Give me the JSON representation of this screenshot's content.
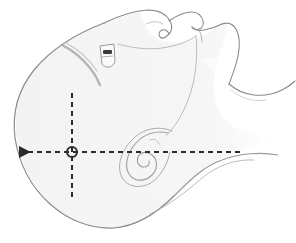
{
  "figure": {
    "background_color": "#ffffff",
    "canvas": {
      "width": 296,
      "height": 243
    }
  },
  "anatomy": {
    "head_fill_color": "#f4f4f4",
    "outline_color": "#8a8a8a",
    "outline_width": 1.1,
    "detail_color": "#9a9a9a",
    "shadow_color": "#b0b0b0",
    "parts": [
      {
        "name": "cranium-outline",
        "label": "Cranium / skull vault"
      },
      {
        "name": "forehead-contour",
        "label": "Forehead"
      },
      {
        "name": "nose-profile",
        "label": "Nose"
      },
      {
        "name": "lips-profile",
        "label": "Lips"
      },
      {
        "name": "chin-profile",
        "label": "Chin"
      },
      {
        "name": "jaw-line",
        "label": "Mandible / jaw line"
      },
      {
        "name": "neck-contour",
        "label": "Neck"
      },
      {
        "name": "throat-line",
        "label": "Throat"
      },
      {
        "name": "ear-spiral",
        "label": "Ear (auricle)"
      },
      {
        "name": "hairline-stroke",
        "label": "Hairline"
      },
      {
        "name": "ear-canal-mark",
        "label": "External auditory meatus"
      },
      {
        "name": "eyebrow-mark",
        "label": "Brow ridge"
      }
    ]
  },
  "axes": {
    "line_color": "#2b2b2b",
    "line_width": 2,
    "dash_pattern": "5,4",
    "horizontal": {
      "name": "horizontal-reference-axis",
      "y": 152,
      "x_start": 20,
      "x_end": 240,
      "arrow_end": "left"
    },
    "vertical": {
      "name": "vertical-reference-axis",
      "x": 72,
      "y_start": 93,
      "y_end": 201,
      "arrow_end": "none"
    },
    "origin_marker": {
      "name": "axis-origin-marker",
      "cx": 72,
      "cy": 152,
      "radius": 5,
      "shape": "circle"
    }
  }
}
